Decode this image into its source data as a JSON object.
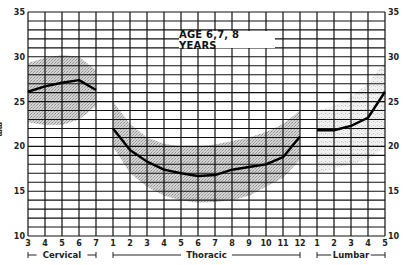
{
  "chart_data": {
    "type": "line",
    "title": "AGE 6,7, 8 YEARS",
    "xlabel": "",
    "ylabel": "mm",
    "ylim": [
      10,
      35
    ],
    "yticks": [
      10,
      15,
      20,
      25,
      30,
      35
    ],
    "grid": true,
    "regions": [
      {
        "name": "Cervical",
        "categories": [
          "3",
          "4",
          "5",
          "6",
          "7"
        ]
      },
      {
        "name": "Thoracic",
        "categories": [
          "1",
          "2",
          "3",
          "4",
          "5",
          "6",
          "7",
          "8",
          "9",
          "10",
          "11",
          "12"
        ]
      },
      {
        "name": "Lumbar",
        "categories": [
          "1",
          "2",
          "3",
          "4",
          "5"
        ]
      }
    ],
    "series": [
      {
        "name": "Cervical mean",
        "region": "Cervical",
        "values": [
          26.1,
          26.7,
          27.1,
          27.4,
          26.3
        ]
      },
      {
        "name": "Thoracic mean",
        "region": "Thoracic",
        "values": [
          22.0,
          19.6,
          18.3,
          17.4,
          17.0,
          16.7,
          16.8,
          17.4,
          17.7,
          18.0,
          18.8,
          21.1
        ]
      },
      {
        "name": "Lumbar mean",
        "region": "Lumbar",
        "values": [
          21.8,
          21.8,
          22.3,
          23.2,
          26.1
        ]
      }
    ],
    "bands": [
      {
        "region": "Cervical",
        "upper": [
          29.3,
          29.9,
          30.2,
          30.0,
          28.5
        ],
        "lower": [
          22.7,
          22.4,
          22.4,
          23.0,
          24.5
        ]
      },
      {
        "region": "Thoracic",
        "upper": [
          25.0,
          22.5,
          21.0,
          20.3,
          20.0,
          20.0,
          20.2,
          20.6,
          21.0,
          21.6,
          22.5,
          24.0
        ],
        "lower": [
          20.0,
          17.0,
          15.5,
          14.5,
          14.0,
          13.7,
          13.8,
          14.0,
          14.5,
          15.5,
          16.5,
          18.5
        ]
      },
      {
        "region": "Lumbar",
        "upper": [
          24.0,
          24.5,
          25.5,
          27.0,
          29.5
        ],
        "lower": [
          17.0,
          17.5,
          18.0,
          18.5,
          20.0
        ]
      }
    ]
  },
  "labels": {
    "title": "AGE 6,7, 8 YEARS",
    "ylabel": "mm",
    "cervical": "Cervical",
    "thoracic": "Thoracic",
    "lumbar": "Lumbar"
  }
}
